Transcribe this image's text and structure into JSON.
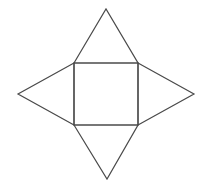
{
  "diagram": {
    "title": "",
    "stroke_color": "#4a4a4a",
    "background": "#ffffff",
    "shapes": {
      "square": {
        "points": "74,63 138,63 138,125 74,125"
      },
      "triangle_top": {
        "points": "74,63 106,9 138,63"
      },
      "triangle_right": {
        "points": "138,63 194,94 138,125"
      },
      "triangle_bottom": {
        "points": "74,125 107,179 138,125"
      },
      "triangle_left": {
        "points": "74,63 18,94 74,125"
      }
    }
  }
}
